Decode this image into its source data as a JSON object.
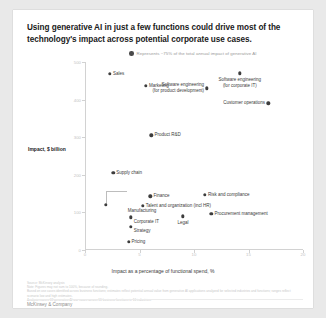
{
  "title": "Using generative AI in just a few functions could drive most of the technology's impact across potential corporate use cases.",
  "legend": {
    "marker_color": "#4a4a4a",
    "label": "Represents ~75% of the total annual impact of generative AI"
  },
  "brand": "McKinsey & Company",
  "notes": [
    "Source: McKinsey analysis",
    "Note: Figures may not sum to 100%, because of rounding.",
    "Based on use cases identified across business functions; estimates reflect potential annual value from generative AI applications analyzed for selected industries and functions; ranges reflect scenario low and high estimates.",
    "Analysis covers 63 generative AI use cases across 16 business functions in 16 industries."
  ],
  "chart_data": {
    "type": "scatter",
    "title": "Using generative AI in just a few functions could drive most of the technology's impact across potential corporate use cases.",
    "xlabel": "Impact as a percentage of functional spend, %",
    "ylabel": "Impact, $ billion",
    "xlim": [
      0,
      20
    ],
    "ylim": [
      0,
      500
    ],
    "xticks": [
      0,
      5,
      10,
      15,
      20
    ],
    "yticks": [
      0,
      100,
      200,
      300,
      400,
      500
    ],
    "grid": false,
    "legend_position": "top-center",
    "marker_color": "#3d3d3d",
    "points": [
      {
        "label": "Sales",
        "x": 2.3,
        "y": 468,
        "lbl_pos": "l"
      },
      {
        "label": "Marketing",
        "x": 5.6,
        "y": 437,
        "lbl_pos": "l"
      },
      {
        "label": "Software engineering\n(for corporate IT)",
        "x": 14.2,
        "y": 470,
        "lbl_pos": "c"
      },
      {
        "label": "Software engineering\n(for product development)",
        "x": 11.2,
        "y": 430,
        "lbl_pos": "r"
      },
      {
        "label": "Customer operations",
        "x": 16.8,
        "y": 390,
        "lbl_pos": "r"
      },
      {
        "label": "Product R&D",
        "x": 6.1,
        "y": 305,
        "lbl_pos": "l"
      },
      {
        "label": "Supply chain",
        "x": 2.6,
        "y": 205,
        "lbl_pos": "l"
      },
      {
        "label": "Manufacturing",
        "x": 1.9,
        "y": 120,
        "lbl_pos": "c"
      },
      {
        "label": "Finance",
        "x": 6.0,
        "y": 143,
        "lbl_pos": "l"
      },
      {
        "label": "Risk and compliance",
        "x": 11.0,
        "y": 146,
        "lbl_pos": "l"
      },
      {
        "label": "Talent and organization (incl HR)",
        "x": 5.3,
        "y": 118,
        "lbl_pos": "l"
      },
      {
        "label": "Procurement management",
        "x": 11.6,
        "y": 97,
        "lbl_pos": "l"
      },
      {
        "label": "Corporate IT",
        "x": 4.2,
        "y": 87,
        "lbl_pos": "c"
      },
      {
        "label": "Legal",
        "x": 9.0,
        "y": 90,
        "lbl_pos": "c"
      },
      {
        "label": "Strategy",
        "x": 4.2,
        "y": 62,
        "lbl_pos": "c"
      },
      {
        "label": "Pricing",
        "x": 4.0,
        "y": 22,
        "lbl_pos": "l"
      }
    ]
  }
}
